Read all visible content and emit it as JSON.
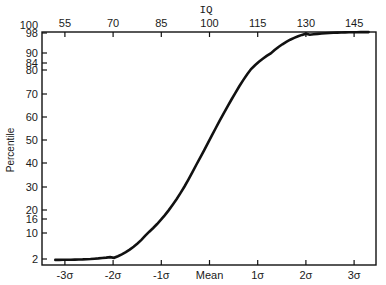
{
  "chart_data": {
    "type": "line",
    "title": "",
    "xlabel": "",
    "ylabel": "Percentile",
    "top_axis_label": "IQ",
    "x_ticks_bottom": [
      "-3σ",
      "-2σ",
      "-1σ",
      "Mean",
      "1σ",
      "2σ",
      "3σ"
    ],
    "x_ticks_top": [
      "55",
      "70",
      "85",
      "100",
      "115",
      "130",
      "145"
    ],
    "y_ticks": [
      "2",
      "10",
      "16",
      "20",
      "30",
      "40",
      "50",
      "60",
      "70",
      "80",
      "84",
      "90",
      "98",
      "100"
    ],
    "xlim": [
      -3.5,
      3.5
    ],
    "ylim": [
      2,
      98
    ],
    "grid": false,
    "series": [
      {
        "name": "Cumulative normal (percentile vs. SD / IQ)",
        "x_sigma": [
          -3.2,
          -3.0,
          -2.5,
          -2.0,
          -1.5,
          -1.0,
          -0.5,
          0.0,
          0.5,
          1.0,
          1.5,
          2.0,
          2.5,
          3.0,
          3.3
        ],
        "x_iq": [
          52,
          55,
          62.5,
          70,
          77.5,
          85,
          92.5,
          100,
          107.5,
          115,
          122.5,
          130,
          137.5,
          145,
          149.5
        ],
        "percentile": [
          0.1,
          0.1,
          0.6,
          2.3,
          6.7,
          15.9,
          30.9,
          50,
          69.1,
          84.1,
          93.3,
          97.7,
          99.4,
          99.9,
          99.95
        ]
      }
    ]
  }
}
